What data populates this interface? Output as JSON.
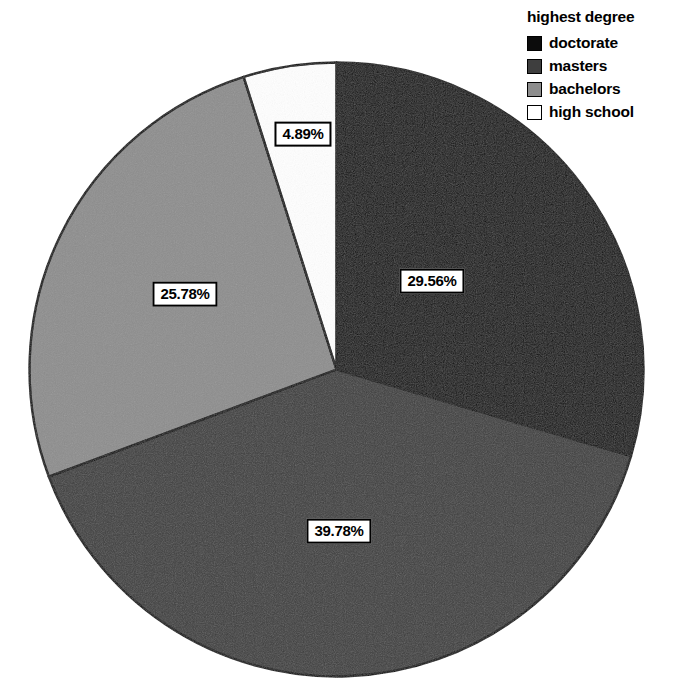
{
  "legend": {
    "title": "highest degree",
    "items": [
      {
        "label": "doctorate",
        "color": "#0c0c0c"
      },
      {
        "label": "masters",
        "color": "#3e3e3e"
      },
      {
        "label": "bachelors",
        "color": "#8d8d8d"
      },
      {
        "label": "high school",
        "color": "#ffffff"
      }
    ]
  },
  "labels": {
    "doctorate": "29.56%",
    "masters": "39.78%",
    "bachelors": "25.78%",
    "high_school": "4.89%"
  },
  "chart_data": {
    "type": "pie",
    "title": "",
    "legend_title": "highest degree",
    "legend_position": "top-right",
    "start_angle_deg": 0,
    "direction": "clockwise",
    "categories": [
      "doctorate",
      "masters",
      "bachelors",
      "high school"
    ],
    "values": [
      29.56,
      39.78,
      25.78,
      4.89
    ],
    "value_unit": "percent",
    "data_labels": [
      "29.56%",
      "39.78%",
      "25.78%",
      "4.89%"
    ],
    "colors": [
      "#0c0c0c",
      "#3e3e3e",
      "#8d8d8d",
      "#ffffff"
    ],
    "slice_border_color": "#000000",
    "grid": false
  }
}
